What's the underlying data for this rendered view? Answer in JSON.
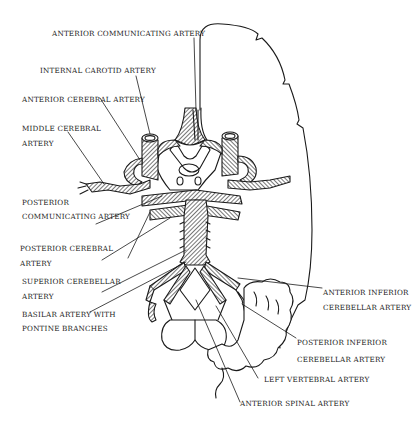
{
  "diagram": {
    "title": "",
    "line_color": "#1a1a1a",
    "background": "#ffffff"
  },
  "labels": [
    {
      "id": "anterior-communicating-artery",
      "lines": [
        "ANTERIOR COMMUNICATING ARTERY"
      ]
    },
    {
      "id": "internal-carotid-artery",
      "lines": [
        "INTERNAL CAROTID ARTERY"
      ]
    },
    {
      "id": "anterior-cerebral-artery",
      "lines": [
        "ANTERIOR CEREBRAL ARTERY"
      ]
    },
    {
      "id": "middle-cerebral-artery",
      "lines": [
        "MIDDLE CEREBRAL",
        "ARTERY"
      ]
    },
    {
      "id": "posterior-communicating-artery",
      "lines": [
        "POSTERIOR",
        "COMMUNICATING  ARTERY"
      ]
    },
    {
      "id": "posterior-cerebral-artery",
      "lines": [
        "POSTERIOR CEREBRAL",
        "ARTERY"
      ]
    },
    {
      "id": "superior-cerebellar-artery",
      "lines": [
        "SUPERIOR CEREBELLAR",
        "ARTERY"
      ]
    },
    {
      "id": "basilar-artery",
      "lines": [
        "BASILAR ARTERY WITH",
        "PONTINE BRANCHES"
      ]
    },
    {
      "id": "anterior-inferior-cerebellar-artery",
      "lines": [
        "ANTERIOR INFERIOR",
        "CEREBELLAR ARTERY"
      ]
    },
    {
      "id": "posterior-inferior-cerebellar-artery",
      "lines": [
        "POSTERIOR INFERIOR",
        "CEREBELLAR ARTERY"
      ]
    },
    {
      "id": "left-vertebral-artery",
      "lines": [
        "LEFT VERTEBRAL ARTERY"
      ]
    },
    {
      "id": "anterior-spinal-artery",
      "lines": [
        "ANTERIOR SPINAL ARTERY"
      ]
    }
  ]
}
